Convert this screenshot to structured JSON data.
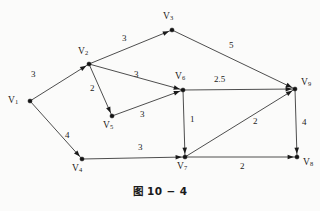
{
  "figure": {
    "caption": "图 10 − 4",
    "background_color": "#fbfbfa",
    "line_color": "#3a3a3a",
    "text_color": "#1c1c1c"
  },
  "chart_data": {
    "type": "diagram",
    "title": "图 10 − 4",
    "subtitle": "",
    "xlabel": "",
    "ylabel": "",
    "graph_kind": "weighted directed network",
    "nodes": [
      {
        "id": "V1",
        "label": "V",
        "sub": "1",
        "x": 30,
        "y": 101,
        "label_x": 8,
        "label_y": 96
      },
      {
        "id": "V2",
        "label": "V",
        "sub": "2",
        "x": 89,
        "y": 64,
        "label_x": 78,
        "label_y": 47
      },
      {
        "id": "V3",
        "label": "V",
        "sub": "3",
        "x": 172,
        "y": 30,
        "label_x": 163,
        "label_y": 12
      },
      {
        "id": "V4",
        "label": "V",
        "sub": "4",
        "x": 82,
        "y": 159,
        "label_x": 72,
        "label_y": 164
      },
      {
        "id": "V5",
        "label": "V",
        "sub": "5",
        "x": 112,
        "y": 116,
        "label_x": 103,
        "label_y": 121
      },
      {
        "id": "V6",
        "label": "V",
        "sub": "6",
        "x": 183,
        "y": 90,
        "label_x": 175,
        "label_y": 72
      },
      {
        "id": "V7",
        "label": "V",
        "sub": "7",
        "x": 185,
        "y": 157,
        "label_x": 177,
        "label_y": 162
      },
      {
        "id": "V8",
        "label": "V",
        "sub": "8",
        "x": 297,
        "y": 157,
        "label_x": 303,
        "label_y": 158
      },
      {
        "id": "V9",
        "label": "V",
        "sub": "9",
        "x": 295,
        "y": 89,
        "label_x": 301,
        "label_y": 78
      }
    ],
    "edges": [
      {
        "from": "V1",
        "to": "V2",
        "weight": "3",
        "label_x": 31,
        "label_y": 70,
        "arrow": true
      },
      {
        "from": "V1",
        "to": "V4",
        "weight": "4",
        "label_x": 65,
        "label_y": 131,
        "arrow": true
      },
      {
        "from": "V2",
        "to": "V3",
        "weight": "3",
        "label_x": 122,
        "label_y": 34,
        "arrow": true
      },
      {
        "from": "V2",
        "to": "V5",
        "weight": "2",
        "label_x": 90,
        "label_y": 84,
        "arrow": true
      },
      {
        "from": "V2",
        "to": "V6",
        "weight": "3",
        "label_x": 134,
        "label_y": 70,
        "arrow": true
      },
      {
        "from": "V3",
        "to": "V9",
        "weight": "5",
        "label_x": 229,
        "label_y": 41,
        "arrow": true
      },
      {
        "from": "V5",
        "to": "V6",
        "weight": "3",
        "label_x": 140,
        "label_y": 110,
        "arrow": true
      },
      {
        "from": "V6",
        "to": "V9",
        "weight": "2.5",
        "label_x": 214,
        "label_y": 75,
        "arrow": true
      },
      {
        "from": "V6",
        "to": "V7",
        "weight": "1",
        "label_x": 190,
        "label_y": 115,
        "arrow": true
      },
      {
        "from": "V4",
        "to": "V7",
        "weight": "3",
        "label_x": 138,
        "label_y": 143,
        "arrow": true
      },
      {
        "from": "V7",
        "to": "V9",
        "weight": "2",
        "label_x": 253,
        "label_y": 117,
        "arrow": true
      },
      {
        "from": "V7",
        "to": "V8",
        "weight": "2",
        "label_x": 240,
        "label_y": 162,
        "arrow": true
      },
      {
        "from": "V9",
        "to": "V8",
        "weight": "4",
        "label_x": 302,
        "label_y": 118,
        "arrow": true
      }
    ]
  }
}
